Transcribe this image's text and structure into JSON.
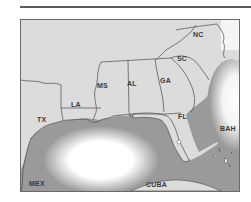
{
  "map": {
    "title_rule": true,
    "region": "Southeastern United States and Gulf of Mexico",
    "colors": {
      "land": "#dcdcdc",
      "water": "#9a9a9a",
      "water_highlight": "#ffffff",
      "border": "#4a4a4a",
      "frame": "#6a6a6a"
    },
    "labels": [
      {
        "id": "nc",
        "text": "NC",
        "x": 172,
        "y": 30
      },
      {
        "id": "sc",
        "text": "SC",
        "x": 155,
        "y": 55
      },
      {
        "id": "ga",
        "text": "GA",
        "x": 140,
        "y": 77
      },
      {
        "id": "al",
        "text": "AL",
        "x": 106,
        "y": 80
      },
      {
        "id": "ms",
        "text": "MS",
        "x": 76,
        "y": 82
      },
      {
        "id": "la",
        "text": "LA",
        "x": 52,
        "y": 101
      },
      {
        "id": "tx",
        "text": "TX",
        "x": 16,
        "y": 116
      },
      {
        "id": "fl",
        "text": "FL",
        "x": 157,
        "y": 113
      },
      {
        "id": "bah",
        "text": "BAH",
        "x": 200,
        "y": 125
      },
      {
        "id": "mex",
        "text": "MEX",
        "x": 10,
        "y": 160
      },
      {
        "id": "cuba",
        "text": "CUBA",
        "x": 126,
        "y": 162
      }
    ]
  }
}
